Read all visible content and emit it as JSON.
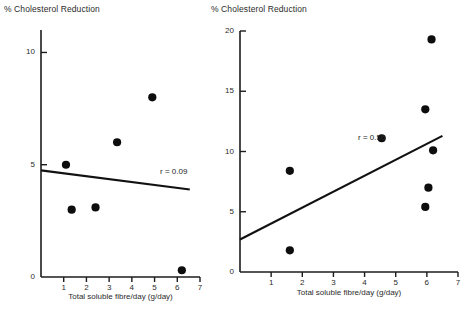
{
  "figure": {
    "background_color": "#ffffff",
    "ink_color": "#111111"
  },
  "panels": [
    {
      "id": "left",
      "title": "% Cholesterol Reduction",
      "xlabel": "Total soluble fibre/day (g/day)",
      "correlation_label": "r = 0.09",
      "y_ticks": [
        "0",
        "5",
        "10"
      ],
      "x_ticks": [
        "1",
        "2",
        "3",
        "4",
        "5",
        "6",
        "7"
      ]
    },
    {
      "id": "right",
      "title": "% Cholesterol Reduction",
      "xlabel": "Total soluble fibre/day (g/day)",
      "correlation_label": "r = 0.56",
      "y_ticks": [
        "0",
        "5",
        "10",
        "15",
        "20"
      ],
      "x_ticks": [
        "1",
        "2",
        "3",
        "4",
        "5",
        "6",
        "7"
      ]
    }
  ],
  "chart_data": [
    {
      "type": "scatter",
      "panel": "left",
      "title": "% Cholesterol Reduction",
      "xlabel": "Total soluble fibre/day (g/day)",
      "ylabel": "% Cholesterol Reduction",
      "xlim": [
        0,
        7
      ],
      "ylim": [
        0,
        11
      ],
      "xticks": [
        1,
        2,
        3,
        4,
        5,
        6,
        7
      ],
      "yticks": [
        0,
        5,
        10
      ],
      "grid": false,
      "legend": "none",
      "annotations": [
        {
          "text": "r = 0.09",
          "x": 5.6,
          "y": 4.45
        }
      ],
      "series": [
        {
          "name": "Trials",
          "marker": "filled-circle",
          "color": "#0d0d0d",
          "points": [
            {
              "x": 1.1,
              "y": 5.0
            },
            {
              "x": 1.35,
              "y": 3.0
            },
            {
              "x": 2.4,
              "y": 3.1
            },
            {
              "x": 3.35,
              "y": 6.0
            },
            {
              "x": 4.9,
              "y": 8.0
            },
            {
              "x": 6.2,
              "y": 0.3
            }
          ]
        }
      ],
      "fit_line": {
        "name": "Regression line",
        "r": 0.09,
        "x_start": 0.0,
        "y_start": 4.75,
        "x_end": 6.55,
        "y_end": 3.9
      }
    },
    {
      "type": "scatter",
      "panel": "right",
      "title": "% Cholesterol Reduction",
      "xlabel": "Total soluble fibre/day (g/day)",
      "ylabel": "% Cholesterol Reduction",
      "xlim": [
        0,
        7
      ],
      "ylim": [
        0,
        20
      ],
      "xticks": [
        1,
        2,
        3,
        4,
        5,
        6,
        7
      ],
      "yticks": [
        0,
        5,
        10,
        15,
        20
      ],
      "grid": false,
      "legend": "none",
      "annotations": [
        {
          "text": "r = 0.56",
          "x": 4.7,
          "y": 10.3
        }
      ],
      "series": [
        {
          "name": "Trials",
          "marker": "filled-circle",
          "color": "#0d0d0d",
          "points": [
            {
              "x": 1.6,
              "y": 8.4
            },
            {
              "x": 1.6,
              "y": 1.8
            },
            {
              "x": 4.55,
              "y": 11.1
            },
            {
              "x": 5.95,
              "y": 13.5
            },
            {
              "x": 5.95,
              "y": 5.4
            },
            {
              "x": 6.05,
              "y": 7.0
            },
            {
              "x": 6.2,
              "y": 10.1
            },
            {
              "x": 6.15,
              "y": 19.3
            }
          ]
        }
      ],
      "fit_line": {
        "name": "Regression line",
        "r": 0.56,
        "x_start": 0.0,
        "y_start": 2.7,
        "x_end": 6.5,
        "y_end": 11.3
      }
    }
  ]
}
